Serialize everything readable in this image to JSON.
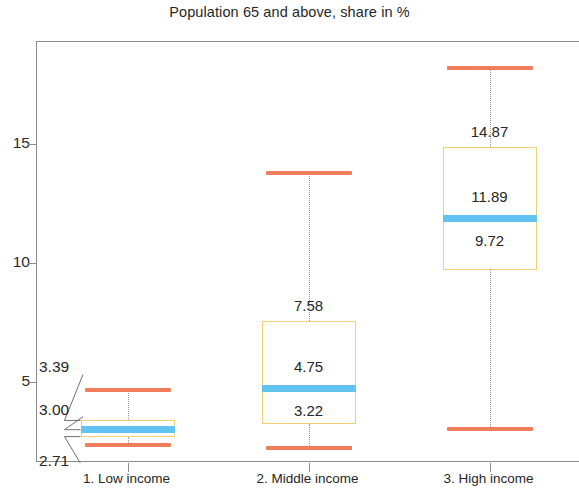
{
  "chart_data": {
    "type": "box",
    "title": "Population 65 and above, share in %",
    "xlabel": "",
    "ylabel": "",
    "ylim": [
      1.6,
      19.3
    ],
    "yticks": [
      5,
      10,
      15
    ],
    "ytick_labels": [
      "5",
      "10",
      "15"
    ],
    "grid": false,
    "legend": null,
    "categories": [
      "1. Low income",
      "2. Middle income",
      "3. High income"
    ],
    "series": [
      {
        "name": "1. Low income",
        "whisker_low": 2.35,
        "q1": 2.71,
        "median": 3.0,
        "q3": 3.39,
        "whisker_high": 4.65,
        "labels": {
          "q3": "3.39",
          "median": "3.00",
          "q1": "2.71"
        },
        "label_style": "callout"
      },
      {
        "name": "2. Middle income",
        "whisker_low": 2.25,
        "q1": 3.22,
        "median": 4.75,
        "q3": 7.58,
        "whisker_high": 13.8,
        "labels": {
          "q3": "7.58",
          "median": "4.75",
          "q1": "3.22"
        },
        "label_style": "inside"
      },
      {
        "name": "3. High income",
        "whisker_low": 3.05,
        "q1": 9.72,
        "median": 11.89,
        "q3": 14.87,
        "whisker_high": 18.2,
        "labels": {
          "q3": "14.87",
          "median": "11.89",
          "q1": "9.72"
        },
        "label_style": "inside"
      }
    ],
    "colors": {
      "whisker_cap": "#f07d5c",
      "box_border": "#f3cf73",
      "median": "#63c3f0",
      "axis": "#8a8a8a",
      "text": "#262626"
    }
  }
}
